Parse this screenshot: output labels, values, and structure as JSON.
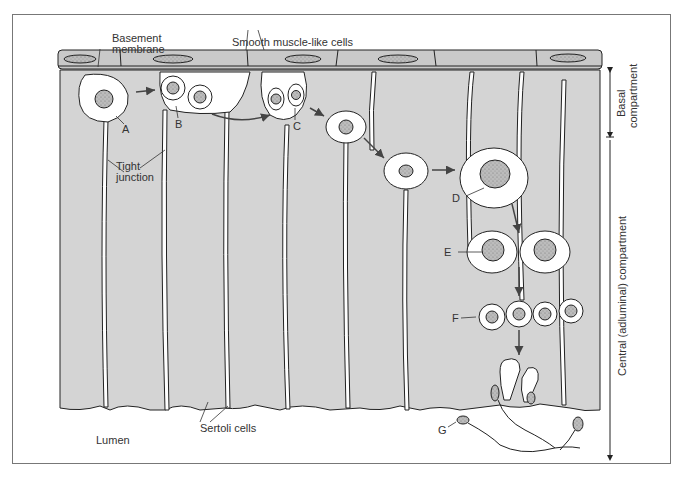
{
  "diagram": {
    "colors": {
      "tissue_fill": "#d4d4d4",
      "muscle_fill": "#c9c9c9",
      "nucleus_fill": "#b8b8b8",
      "lumen": "#ffffff",
      "line": "#222222",
      "arrow": "#444444",
      "frame": "#777777"
    },
    "labels": {
      "basement_membrane_l1": "Basement",
      "basement_membrane_l2": "membrane",
      "smooth_muscle": "Smooth muscle-like cells",
      "tight_junction_l1": "Tight",
      "tight_junction_l2": "junction",
      "sertoli": "Sertoli cells",
      "lumen": "Lumen",
      "A": "A",
      "B": "B",
      "C": "C",
      "D": "D",
      "E": "E",
      "F": "F",
      "G": "G"
    },
    "compartments": {
      "basal": "Basal",
      "basal_2": "compartment",
      "central": "Central (adluminal) compartment"
    }
  }
}
